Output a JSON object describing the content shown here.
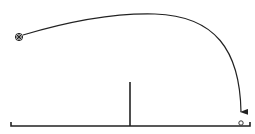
{
  "diagram": {
    "colors": {
      "stroke": "#222222",
      "background": "#ffffff"
    },
    "launcher": {
      "icon": "asterisk-circle-icon",
      "x": 19,
      "y": 37
    },
    "trajectory": {
      "start": [
        22,
        36
      ],
      "peak": [
        150,
        14
      ],
      "end": [
        241,
        117
      ]
    },
    "wall": {
      "x": 130,
      "top": 82,
      "bottom": 126
    },
    "ground": {
      "y": 126,
      "x_start": 11,
      "x_end": 250
    },
    "target": {
      "icon": "circle-icon",
      "x": 241,
      "y": 123
    }
  }
}
